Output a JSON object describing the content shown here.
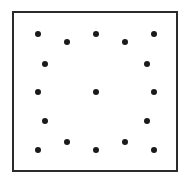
{
  "figure": {
    "width": 189,
    "height": 184,
    "background_color": "#ffffff"
  },
  "frame": {
    "name": "square-border",
    "x": 12,
    "y": 11,
    "width": 166,
    "height": 161,
    "stroke_color": "#2b2b2b",
    "stroke_width": 2,
    "fill": "none"
  },
  "marker_style": {
    "shape": "circle",
    "color": "#1a1a1a",
    "diameter": 6
  },
  "chart_data": {
    "type": "scatter",
    "title": "",
    "xlabel": "",
    "ylabel": "",
    "grid": false,
    "legend": null,
    "xlim": [
      12,
      178
    ],
    "ylim": [
      11,
      172
    ],
    "point_count": 16,
    "series": [
      {
        "name": "dots",
        "color": "#1a1a1a",
        "points": [
          {
            "id": "top-1",
            "x": 38,
            "y": 34
          },
          {
            "id": "top-2",
            "x": 67,
            "y": 42
          },
          {
            "id": "top-3",
            "x": 96,
            "y": 34
          },
          {
            "id": "top-4",
            "x": 125,
            "y": 42
          },
          {
            "id": "top-5",
            "x": 154,
            "y": 34
          },
          {
            "id": "left-2",
            "x": 45,
            "y": 64
          },
          {
            "id": "right-2",
            "x": 147,
            "y": 64
          },
          {
            "id": "mid-left",
            "x": 38,
            "y": 92
          },
          {
            "id": "center",
            "x": 96,
            "y": 92
          },
          {
            "id": "mid-right",
            "x": 154,
            "y": 92
          },
          {
            "id": "left-4",
            "x": 45,
            "y": 121
          },
          {
            "id": "right-4",
            "x": 147,
            "y": 121
          },
          {
            "id": "bot-1",
            "x": 38,
            "y": 150
          },
          {
            "id": "bot-2",
            "x": 67,
            "y": 142
          },
          {
            "id": "bot-3",
            "x": 96,
            "y": 150
          },
          {
            "id": "bot-4",
            "x": 125,
            "y": 142
          },
          {
            "id": "bot-5",
            "x": 154,
            "y": 150
          }
        ]
      }
    ]
  }
}
